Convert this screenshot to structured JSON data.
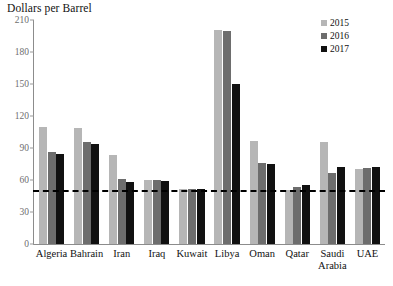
{
  "chart_data": {
    "type": "bar",
    "title": "Dollars per Barrel",
    "xlabel": "",
    "ylabel": "Dollars per Barrel",
    "ylim": [
      0,
      210
    ],
    "yticks": [
      0,
      30,
      60,
      90,
      120,
      150,
      180,
      210
    ],
    "grid": false,
    "legend_position": "top-right",
    "categories": [
      "Algeria",
      "Bahrain",
      "Iran",
      "Iraq",
      "Kuwait",
      "Libya",
      "Oman",
      "Qatar",
      "Saudi\nArabia",
      "UAE"
    ],
    "series": [
      {
        "name": "2015",
        "color": "#b6b6b6",
        "values": [
          110,
          109,
          83,
          60,
          52,
          201,
          97,
          51,
          96,
          70
        ]
      },
      {
        "name": "2016",
        "color": "#6d6d6d",
        "values": [
          86,
          96,
          61,
          60,
          52,
          200,
          76,
          53,
          67,
          71
        ]
      },
      {
        "name": "2017",
        "color": "#111111",
        "values": [
          84,
          94,
          58,
          59,
          52,
          150,
          75,
          55,
          72,
          72
        ]
      }
    ],
    "reference_line": {
      "value": 50,
      "style": "dashed",
      "color": "#000000"
    }
  }
}
